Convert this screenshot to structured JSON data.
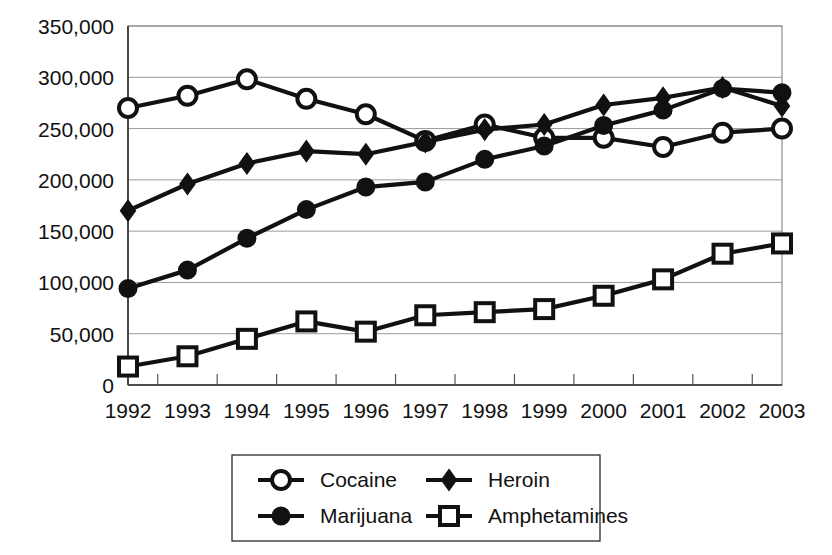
{
  "chart_data": {
    "type": "line",
    "title": "",
    "subtitle": "",
    "xlabel": "",
    "ylabel": "",
    "categories": [
      "1992",
      "1993",
      "1994",
      "1995",
      "1996",
      "1997",
      "1998",
      "1999",
      "2000",
      "2001",
      "2002",
      "2003"
    ],
    "x": [
      1992,
      1993,
      1994,
      1995,
      1996,
      1997,
      1998,
      1999,
      2000,
      2001,
      2002,
      2003
    ],
    "ylim": [
      0,
      350000
    ],
    "xlim": [
      1992,
      2003
    ],
    "grid": true,
    "grid_axis": "y",
    "legend_position": "bottom",
    "y_ticks": [
      0,
      50000,
      100000,
      150000,
      200000,
      250000,
      300000,
      350000
    ],
    "y_tick_labels": [
      "0",
      "50,000",
      "100,000",
      "150,000",
      "200,000",
      "250,000",
      "300,000",
      "350,000"
    ],
    "x_tick_labels": [
      "1992",
      "1993",
      "1994",
      "1995",
      "1996",
      "1997",
      "1998",
      "1999",
      "2000",
      "2001",
      "2002",
      "2003"
    ],
    "series": [
      {
        "name": "Cocaine",
        "marker": "open-circle",
        "color": "#111111",
        "values": [
          270000,
          282000,
          298000,
          279000,
          264000,
          238000,
          254000,
          241000,
          241000,
          232000,
          246000,
          250000
        ]
      },
      {
        "name": "Heroin",
        "marker": "filled-diamond",
        "color": "#111111",
        "values": [
          170000,
          196000,
          216000,
          228000,
          225000,
          237000,
          249000,
          254000,
          273000,
          280000,
          290000,
          272000
        ]
      },
      {
        "name": "Marijuana",
        "marker": "filled-circle",
        "color": "#111111",
        "values": [
          94000,
          112000,
          143000,
          171000,
          193000,
          198000,
          220000,
          233000,
          253000,
          268000,
          289000,
          285000
        ]
      },
      {
        "name": "Amphetamines",
        "marker": "open-square",
        "color": "#111111",
        "values": [
          18000,
          28000,
          45000,
          62000,
          52000,
          68000,
          71000,
          74000,
          87000,
          103000,
          128000,
          138000
        ]
      }
    ]
  },
  "legend": {
    "entries": [
      {
        "label": "Cocaine",
        "marker": "open-circle"
      },
      {
        "label": "Heroin",
        "marker": "filled-diamond"
      },
      {
        "label": "Marijuana",
        "marker": "filled-circle"
      },
      {
        "label": "Amphetamines",
        "marker": "open-square"
      }
    ]
  }
}
